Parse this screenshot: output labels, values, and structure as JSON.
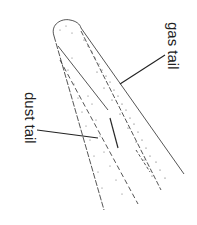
{
  "diagram": {
    "labels": {
      "gas_tail": "gas tail",
      "dust_tail": "dust tail"
    },
    "colors": {
      "line": "#2a2a2a",
      "speckle": "#555555",
      "background": "#ffffff"
    }
  }
}
